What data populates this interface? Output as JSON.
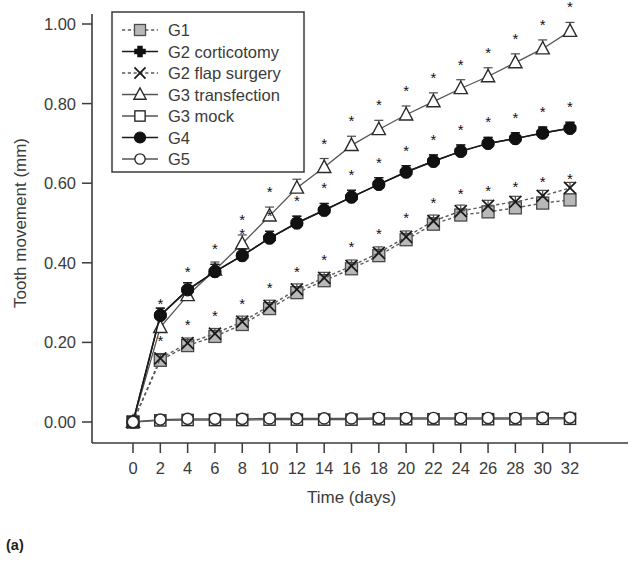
{
  "figure": {
    "panel_label": "(a)"
  },
  "chart_data": {
    "type": "line",
    "title": "",
    "xlabel": "Time (days)",
    "ylabel": "Tooth movement (mm)",
    "xlim": [
      0,
      32
    ],
    "ylim": [
      0.0,
      1.0
    ],
    "xticks": [
      0,
      2,
      4,
      6,
      8,
      10,
      12,
      14,
      16,
      18,
      20,
      22,
      24,
      26,
      28,
      30,
      32
    ],
    "xtick_labels": [
      "0",
      "2",
      "4",
      "6",
      "8",
      "10",
      "12",
      "14",
      "16",
      "18",
      "20",
      "22",
      "24",
      "26",
      "28",
      "30",
      "32"
    ],
    "yticks": [
      0.0,
      0.2,
      0.4,
      0.6,
      0.8,
      1.0
    ],
    "ytick_labels": [
      "0.00",
      "0.20",
      "0.40",
      "0.60",
      "0.80",
      "1.00"
    ],
    "grid": false,
    "legend_position": "top-left",
    "significance_marker": "*",
    "x": [
      0,
      2,
      4,
      6,
      8,
      10,
      12,
      14,
      16,
      18,
      20,
      22,
      24,
      26,
      28,
      30,
      32
    ],
    "series": [
      {
        "name": "G1",
        "marker": "square-gray",
        "linestyle": "dashed",
        "color": "#b8b8b8",
        "values": [
          0.0,
          0.155,
          0.192,
          0.215,
          0.245,
          0.285,
          0.325,
          0.355,
          0.385,
          0.418,
          0.458,
          0.497,
          0.52,
          0.528,
          0.538,
          0.55,
          0.558
        ],
        "errors": [
          0.0,
          0.012,
          0.013,
          0.013,
          0.015,
          0.014,
          0.015,
          0.015,
          0.016,
          0.016,
          0.016,
          0.016,
          0.015,
          0.015,
          0.015,
          0.015,
          0.015
        ],
        "significant": [
          false,
          true,
          true,
          true,
          true,
          true,
          true,
          true,
          true,
          true,
          true,
          true,
          true,
          true,
          true,
          true,
          true
        ]
      },
      {
        "name": "G2 corticotomy",
        "marker": "plus-filled",
        "linestyle": "solid",
        "color": "#111111",
        "values": [
          0.0,
          0.268,
          0.332,
          0.378,
          0.418,
          0.462,
          0.5,
          0.532,
          0.565,
          0.597,
          0.628,
          0.655,
          0.68,
          0.7,
          0.712,
          0.726,
          0.738
        ],
        "errors": [
          0.0,
          0.018,
          0.018,
          0.018,
          0.017,
          0.017,
          0.017,
          0.017,
          0.017,
          0.017,
          0.016,
          0.016,
          0.016,
          0.015,
          0.015,
          0.015,
          0.015
        ],
        "significant": [
          false,
          true,
          true,
          true,
          true,
          true,
          true,
          true,
          true,
          true,
          true,
          true,
          true,
          true,
          true,
          true,
          true
        ]
      },
      {
        "name": "G2 flap surgery",
        "marker": "x",
        "linestyle": "dashed",
        "color": "#5a5a5a",
        "values": [
          0.0,
          0.16,
          0.198,
          0.222,
          0.252,
          0.292,
          0.333,
          0.362,
          0.392,
          0.425,
          0.465,
          0.505,
          0.53,
          0.543,
          0.553,
          0.568,
          0.588
        ],
        "errors": [
          0.0,
          0.012,
          0.013,
          0.013,
          0.014,
          0.014,
          0.014,
          0.014,
          0.015,
          0.015,
          0.015,
          0.015,
          0.015,
          0.014,
          0.014,
          0.014,
          0.014
        ],
        "significant": [
          false,
          true,
          true,
          true,
          true,
          true,
          true,
          true,
          true,
          true,
          true,
          true,
          true,
          true,
          true,
          true,
          true
        ]
      },
      {
        "name": "G3 transfection",
        "marker": "triangle-open",
        "linestyle": "thin",
        "color": "#555555",
        "values": [
          0.0,
          0.238,
          0.318,
          0.382,
          0.448,
          0.518,
          0.588,
          0.64,
          0.695,
          0.735,
          0.772,
          0.805,
          0.838,
          0.868,
          0.903,
          0.938,
          0.982
        ],
        "errors": [
          0.0,
          0.02,
          0.02,
          0.02,
          0.022,
          0.022,
          0.022,
          0.022,
          0.023,
          0.023,
          0.022,
          0.022,
          0.022,
          0.022,
          0.022,
          0.022,
          0.022
        ],
        "significant": [
          false,
          true,
          true,
          true,
          true,
          true,
          true,
          true,
          true,
          true,
          true,
          true,
          true,
          true,
          true,
          true,
          true
        ]
      },
      {
        "name": "G3 mock",
        "marker": "square-open",
        "linestyle": "thin",
        "color": "#555555",
        "values": [
          0.0,
          0.004,
          0.005,
          0.005,
          0.005,
          0.006,
          0.006,
          0.006,
          0.006,
          0.007,
          0.007,
          0.007,
          0.007,
          0.007,
          0.007,
          0.008,
          0.008
        ],
        "errors": [
          0.0,
          0.0,
          0.0,
          0.0,
          0.0,
          0.0,
          0.0,
          0.0,
          0.0,
          0.0,
          0.0,
          0.0,
          0.0,
          0.0,
          0.0,
          0.0,
          0.0
        ],
        "significant": [
          false,
          false,
          false,
          false,
          false,
          false,
          false,
          false,
          false,
          false,
          false,
          false,
          false,
          false,
          false,
          false,
          false
        ]
      },
      {
        "name": "G4",
        "marker": "circle-filled",
        "linestyle": "solid",
        "color": "#111111",
        "values": [
          0.0,
          0.268,
          0.332,
          0.378,
          0.418,
          0.462,
          0.5,
          0.532,
          0.565,
          0.597,
          0.628,
          0.655,
          0.68,
          0.7,
          0.712,
          0.726,
          0.738
        ],
        "errors": [
          0.0,
          0.018,
          0.018,
          0.018,
          0.017,
          0.017,
          0.017,
          0.017,
          0.017,
          0.017,
          0.016,
          0.016,
          0.016,
          0.015,
          0.015,
          0.015,
          0.015
        ],
        "significant": [
          false,
          true,
          true,
          true,
          true,
          true,
          true,
          true,
          true,
          true,
          true,
          true,
          true,
          true,
          true,
          true,
          true
        ]
      },
      {
        "name": "G5",
        "marker": "circle-open",
        "linestyle": "thin",
        "color": "#555555",
        "values": [
          0.0,
          0.006,
          0.008,
          0.008,
          0.008,
          0.009,
          0.009,
          0.009,
          0.009,
          0.01,
          0.01,
          0.01,
          0.01,
          0.01,
          0.01,
          0.011,
          0.011
        ],
        "errors": [
          0.0,
          0.0,
          0.0,
          0.0,
          0.0,
          0.0,
          0.0,
          0.0,
          0.0,
          0.0,
          0.0,
          0.0,
          0.0,
          0.0,
          0.0,
          0.0,
          0.0
        ],
        "significant": [
          false,
          false,
          false,
          false,
          false,
          false,
          false,
          false,
          false,
          false,
          false,
          false,
          false,
          false,
          false,
          false,
          false
        ]
      }
    ],
    "legend_entries": [
      {
        "label": "G1",
        "marker": "square-gray",
        "linestyle": "dashed"
      },
      {
        "label": "G2 corticotomy",
        "marker": "plus-filled",
        "linestyle": "solid"
      },
      {
        "label": "G2 flap surgery",
        "marker": "x",
        "linestyle": "dashed"
      },
      {
        "label": "G3 transfection",
        "marker": "triangle-open",
        "linestyle": "thin"
      },
      {
        "label": "G3 mock",
        "marker": "square-open",
        "linestyle": "thin"
      },
      {
        "label": "G4",
        "marker": "circle-filled",
        "linestyle": "solid"
      },
      {
        "label": "G5",
        "marker": "circle-open",
        "linestyle": "thin"
      }
    ]
  }
}
